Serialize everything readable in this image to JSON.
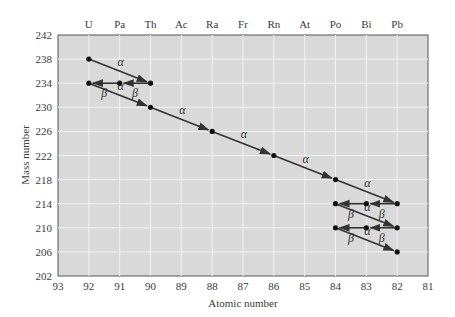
{
  "chart_data": {
    "type": "scatter",
    "title": "",
    "xlabel": "Atomic number",
    "ylabel": "Mass number",
    "xlim": [
      93,
      81
    ],
    "ylim": [
      202,
      242
    ],
    "x_ticks": [
      93,
      92,
      91,
      90,
      89,
      88,
      87,
      86,
      85,
      84,
      83,
      82,
      81
    ],
    "y_ticks": [
      202,
      206,
      210,
      214,
      218,
      222,
      226,
      230,
      234,
      238,
      242
    ],
    "top_axis_labels": [
      {
        "z": 92,
        "symbol": "U"
      },
      {
        "z": 91,
        "symbol": "Pa"
      },
      {
        "z": 90,
        "symbol": "Th"
      },
      {
        "z": 89,
        "symbol": "Ac"
      },
      {
        "z": 88,
        "symbol": "Ra"
      },
      {
        "z": 87,
        "symbol": "Fr"
      },
      {
        "z": 86,
        "symbol": "Rn"
      },
      {
        "z": 85,
        "symbol": "At"
      },
      {
        "z": 84,
        "symbol": "Po"
      },
      {
        "z": 83,
        "symbol": "Bi"
      },
      {
        "z": 82,
        "symbol": "Pb"
      }
    ],
    "grid": true,
    "legend": null,
    "points": [
      {
        "z": 92,
        "a": 238
      },
      {
        "z": 90,
        "a": 234
      },
      {
        "z": 91,
        "a": 234
      },
      {
        "z": 92,
        "a": 234
      },
      {
        "z": 90,
        "a": 230
      },
      {
        "z": 88,
        "a": 226
      },
      {
        "z": 86,
        "a": 222
      },
      {
        "z": 84,
        "a": 218
      },
      {
        "z": 82,
        "a": 214
      },
      {
        "z": 83,
        "a": 214
      },
      {
        "z": 84,
        "a": 214
      },
      {
        "z": 82,
        "a": 210
      },
      {
        "z": 83,
        "a": 210
      },
      {
        "z": 84,
        "a": 210
      },
      {
        "z": 82,
        "a": 206
      }
    ],
    "decays": [
      {
        "from": [
          92,
          238
        ],
        "to": [
          90,
          234
        ],
        "type": "alpha",
        "label": "α"
      },
      {
        "from": [
          90,
          234
        ],
        "to": [
          91,
          234
        ],
        "type": "beta",
        "label": "β"
      },
      {
        "from": [
          91,
          234
        ],
        "to": [
          92,
          234
        ],
        "type": "beta",
        "label": "β"
      },
      {
        "from": [
          92,
          234
        ],
        "to": [
          90,
          230
        ],
        "type": "alpha",
        "label": "α"
      },
      {
        "from": [
          90,
          230
        ],
        "to": [
          88,
          226
        ],
        "type": "alpha",
        "label": "α"
      },
      {
        "from": [
          88,
          226
        ],
        "to": [
          86,
          222
        ],
        "type": "alpha",
        "label": "α"
      },
      {
        "from": [
          86,
          222
        ],
        "to": [
          84,
          218
        ],
        "type": "alpha",
        "label": "α"
      },
      {
        "from": [
          84,
          218
        ],
        "to": [
          82,
          214
        ],
        "type": "alpha",
        "label": "α"
      },
      {
        "from": [
          82,
          214
        ],
        "to": [
          83,
          214
        ],
        "type": "beta",
        "label": "β"
      },
      {
        "from": [
          83,
          214
        ],
        "to": [
          84,
          214
        ],
        "type": "beta",
        "label": "β"
      },
      {
        "from": [
          84,
          214
        ],
        "to": [
          82,
          210
        ],
        "type": "alpha",
        "label": "α"
      },
      {
        "from": [
          82,
          210
        ],
        "to": [
          83,
          210
        ],
        "type": "beta",
        "label": "β"
      },
      {
        "from": [
          83,
          210
        ],
        "to": [
          84,
          210
        ],
        "type": "beta",
        "label": "β"
      },
      {
        "from": [
          84,
          210
        ],
        "to": [
          82,
          206
        ],
        "type": "alpha",
        "label": "α"
      }
    ]
  },
  "colors": {
    "plot_bg": "#d9d9d9",
    "grid": "#f2f2f2",
    "line": "#333333",
    "point": "#111111"
  }
}
